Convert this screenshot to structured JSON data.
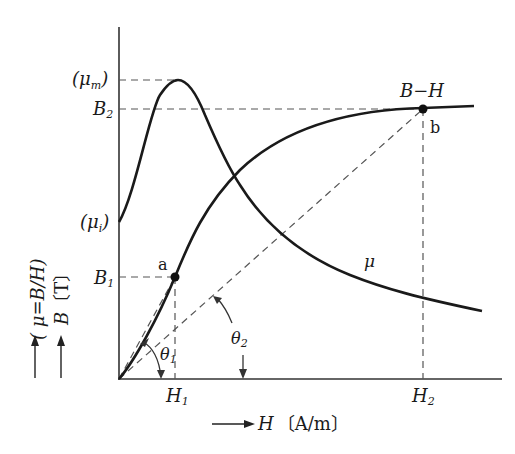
{
  "diagram": {
    "type": "magnetization-curve",
    "axes": {
      "x": {
        "symbol": "H",
        "unit": "〔A/m〕"
      },
      "y": {
        "label_B": "B",
        "unit_B": "〔T〕",
        "label_mu": "( μ=B/H)"
      }
    },
    "curves": {
      "bh": {
        "label": "B−H"
      },
      "mu": {
        "label": "μ"
      }
    },
    "y_ticks": {
      "mu_m": {
        "open": "(",
        "sym": "μ",
        "sub": "m",
        "close": ")"
      },
      "B2": {
        "sym": "B",
        "sub": "2"
      },
      "mu_i": {
        "open": "(",
        "sym": "μ",
        "sub": "i",
        "close": ")"
      },
      "B1": {
        "sym": "B",
        "sub": "1"
      }
    },
    "x_ticks": {
      "H1": {
        "sym": "H",
        "sub": "1"
      },
      "H2": {
        "sym": "H",
        "sub": "2"
      }
    },
    "points": {
      "a": {
        "label": "a"
      },
      "b": {
        "label": "b"
      }
    },
    "angles": {
      "theta1": {
        "sym": "θ",
        "sub": "1"
      },
      "theta2": {
        "sym": "θ",
        "sub": "2"
      }
    },
    "colors": {
      "line": "#1a1a1a",
      "dash": "#555555"
    }
  }
}
